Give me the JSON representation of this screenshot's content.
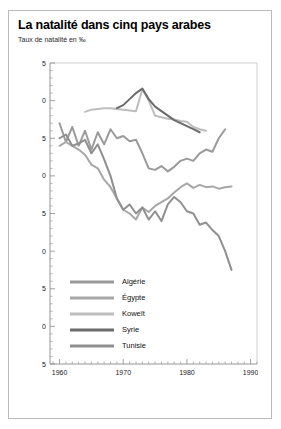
{
  "card": {
    "title": "La natalité dans cinq pays arabes",
    "subtitle": "Taux de natalité en ‰"
  },
  "chart_data": {
    "type": "line",
    "title": "La natalité dans cinq pays arabes",
    "subtitle": "Taux de natalité en ‰",
    "xlabel": "",
    "ylabel": "Taux de natalité en ‰",
    "xlim": [
      1958.5,
      1991
    ],
    "ylim": [
      15,
      55
    ],
    "yticks": [
      15,
      20,
      25,
      30,
      35,
      40,
      45,
      50,
      55
    ],
    "ytick_labels": [
      "15",
      "20",
      "25",
      "30",
      "35",
      "40",
      "45",
      "50",
      "55"
    ],
    "yminor_step": 1,
    "xticks": [
      1960,
      1970,
      1980,
      1990
    ],
    "xtick_labels": [
      "1960",
      "1970",
      "1980",
      "1990"
    ],
    "xminor_step": 1,
    "grid": false,
    "legend_position": "bottom-left-inside",
    "series": [
      {
        "name": "Algérie",
        "color": "#9a9a9a",
        "x": [
          1960,
          1961,
          1962,
          1963,
          1964,
          1965,
          1966,
          1967,
          1968,
          1969,
          1970,
          1971,
          1972,
          1973,
          1974,
          1975,
          1976,
          1977,
          1978,
          1979,
          1980,
          1981,
          1982,
          1983,
          1984,
          1985,
          1986
        ],
        "y": [
          47.0,
          44.5,
          46.5,
          44.0,
          46.0,
          43.5,
          45.8,
          44.2,
          46.2,
          45.0,
          45.3,
          44.6,
          44.8,
          43.0,
          41.0,
          40.8,
          41.3,
          40.6,
          41.2,
          42.0,
          42.3,
          42.0,
          43.0,
          43.5,
          43.2,
          45.0,
          46.2
        ]
      },
      {
        "name": "Égypte",
        "color": "#a7a7a7",
        "x": [
          1960,
          1961,
          1962,
          1963,
          1964,
          1965,
          1966,
          1967,
          1968,
          1969,
          1970,
          1971,
          1972,
          1973,
          1974,
          1975,
          1976,
          1977,
          1978,
          1979,
          1980,
          1981,
          1982,
          1983,
          1984,
          1985,
          1986,
          1987
        ],
        "y": [
          44.0,
          44.5,
          44.0,
          43.5,
          42.8,
          41.5,
          41.0,
          39.5,
          38.5,
          37.0,
          35.5,
          35.0,
          34.2,
          35.8,
          35.2,
          36.0,
          36.5,
          37.0,
          37.8,
          38.5,
          39.0,
          38.4,
          38.8,
          38.5,
          38.6,
          38.3,
          38.5,
          38.6
        ]
      },
      {
        "name": "Koweït",
        "color": "#bdbdbd",
        "x": [
          1964,
          1965,
          1966,
          1967,
          1968,
          1969,
          1970,
          1971,
          1972,
          1973,
          1974,
          1975,
          1976,
          1977,
          1978,
          1979,
          1980,
          1981,
          1982,
          1983
        ],
        "y": [
          48.5,
          48.8,
          48.9,
          49.0,
          49.0,
          48.9,
          48.8,
          48.7,
          48.6,
          51.5,
          50.0,
          48.0,
          47.8,
          47.6,
          47.5,
          47.3,
          47.2,
          46.5,
          46.2,
          46.0
        ]
      },
      {
        "name": "Syrie",
        "color": "#6b6b6b",
        "x": [
          1969,
          1970,
          1971,
          1972,
          1973,
          1974,
          1975,
          1976,
          1977,
          1978,
          1979,
          1980,
          1981,
          1982
        ],
        "y": [
          49.0,
          49.4,
          50.2,
          51.0,
          51.6,
          50.2,
          49.2,
          48.6,
          48.0,
          47.4,
          47.0,
          46.6,
          46.2,
          45.8
        ]
      },
      {
        "name": "Tunisie",
        "color": "#8f8f8f",
        "x": [
          1960,
          1961,
          1962,
          1963,
          1964,
          1965,
          1966,
          1967,
          1968,
          1969,
          1970,
          1971,
          1972,
          1973,
          1974,
          1975,
          1976,
          1977,
          1978,
          1979,
          1980,
          1981,
          1982,
          1983,
          1984,
          1985,
          1986,
          1987
        ],
        "y": [
          45.0,
          45.5,
          44.0,
          44.3,
          44.8,
          43.0,
          44.2,
          42.2,
          40.0,
          37.0,
          35.5,
          36.2,
          35.0,
          35.8,
          34.2,
          35.3,
          34.0,
          36.2,
          37.2,
          36.5,
          35.3,
          35.0,
          33.5,
          33.8,
          32.8,
          32.0,
          30.0,
          27.5
        ]
      }
    ],
    "legend": [
      {
        "label": "Algérie",
        "color": "#9a9a9a"
      },
      {
        "label": "Égypte",
        "color": "#a7a7a7"
      },
      {
        "label": "Koweït",
        "color": "#bdbdbd"
      },
      {
        "label": "Syrie",
        "color": "#6b6b6b"
      },
      {
        "label": "Tunisie",
        "color": "#8f8f8f"
      }
    ]
  }
}
